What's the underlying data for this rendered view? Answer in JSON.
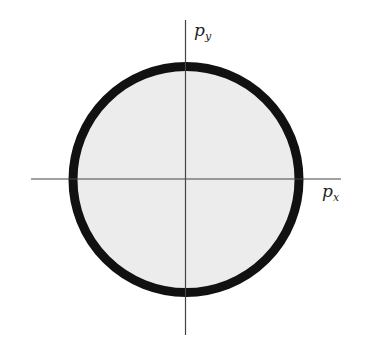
{
  "diagram": {
    "axes": {
      "x_label": "p",
      "x_sub": "x",
      "y_label": "p",
      "y_sub": "y"
    },
    "circle": {
      "fill": "#ececec",
      "stroke": "#111111"
    }
  }
}
